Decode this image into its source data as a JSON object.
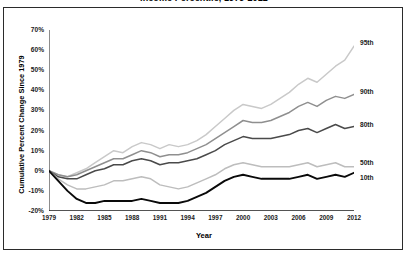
{
  "title": "Income Percentile, 1979-2012",
  "axis": {
    "ylabel": "Cumulative Percent Change Since 1979",
    "xlabel": "Year"
  },
  "chart_data": {
    "type": "line",
    "title": "Income Percentile, 1979-2012",
    "xlabel": "Year",
    "ylabel": "Cumulative Percent Change Since 1979",
    "xlim": [
      1979,
      2012
    ],
    "ylim": [
      -20,
      70
    ],
    "ytick_labels": [
      "70%",
      "60%",
      "50%",
      "40%",
      "30%",
      "20%",
      "10%",
      "0%",
      "-10%",
      "-20%"
    ],
    "ytick_values": [
      70,
      60,
      50,
      40,
      30,
      20,
      10,
      0,
      -10,
      -20
    ],
    "xtick_labels": [
      "1979",
      "1982",
      "1985",
      "1988",
      "1991",
      "1994",
      "1997",
      "2000",
      "2003",
      "2006",
      "2009",
      "2012"
    ],
    "xtick_values": [
      1979,
      1982,
      1985,
      1988,
      1991,
      1994,
      1997,
      2000,
      2003,
      2006,
      2009,
      2012
    ],
    "grid": false,
    "legend_position": "right-inline",
    "x": [
      1979,
      1980,
      1981,
      1982,
      1983,
      1984,
      1985,
      1986,
      1987,
      1988,
      1989,
      1990,
      1991,
      1992,
      1993,
      1994,
      1995,
      1996,
      1997,
      1998,
      1999,
      2000,
      2001,
      2002,
      2003,
      2004,
      2005,
      2006,
      2007,
      2008,
      2009,
      2010,
      2011,
      2012
    ],
    "series": [
      {
        "name": "95th",
        "color": "#c9c9c9",
        "values": [
          0,
          -2,
          -3,
          -1,
          1,
          4,
          7,
          10,
          9,
          12,
          14,
          13,
          11,
          13,
          12,
          13,
          15,
          18,
          22,
          26,
          30,
          33,
          32,
          31,
          33,
          36,
          39,
          43,
          46,
          44,
          48,
          52,
          55,
          62
        ]
      },
      {
        "name": "90th",
        "color": "#8f8f8f",
        "values": [
          0,
          -2,
          -3,
          -2,
          0,
          2,
          4,
          6,
          6,
          8,
          10,
          9,
          7,
          8,
          8,
          9,
          11,
          13,
          16,
          19,
          22,
          25,
          24,
          24,
          25,
          27,
          29,
          32,
          34,
          32,
          35,
          37,
          36,
          38
        ]
      },
      {
        "name": "80th",
        "color": "#4a4a4a",
        "values": [
          0,
          -3,
          -4,
          -4,
          -2,
          0,
          1,
          3,
          3,
          5,
          6,
          5,
          3,
          4,
          4,
          5,
          6,
          8,
          10,
          13,
          15,
          17,
          16,
          16,
          16,
          17,
          18,
          20,
          21,
          19,
          21,
          23,
          21,
          22
        ]
      },
      {
        "name": "50th",
        "color": "#bdbdbd",
        "values": [
          0,
          -4,
          -7,
          -9,
          -9,
          -8,
          -7,
          -5,
          -5,
          -4,
          -3,
          -4,
          -7,
          -8,
          -9,
          -8,
          -6,
          -4,
          -2,
          1,
          3,
          4,
          3,
          2,
          2,
          2,
          2,
          3,
          4,
          2,
          3,
          4,
          2,
          2
        ]
      },
      {
        "name": "10th",
        "color": "#0a0a0a",
        "values": [
          0,
          -5,
          -10,
          -14,
          -16,
          -16,
          -15,
          -15,
          -15,
          -15,
          -14,
          -15,
          -16,
          -16,
          -16,
          -15,
          -13,
          -11,
          -8,
          -5,
          -3,
          -2,
          -3,
          -4,
          -4,
          -4,
          -4,
          -3,
          -2,
          -4,
          -3,
          -2,
          -3,
          -1
        ]
      }
    ]
  }
}
